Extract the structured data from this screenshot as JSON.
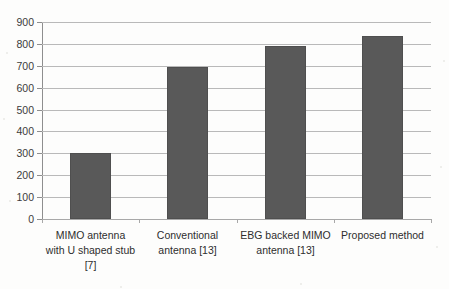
{
  "chart_data": {
    "type": "bar",
    "title": "",
    "xlabel": "",
    "ylabel": "",
    "categories": [
      "MIMO antenna with U shaped stub [7]",
      "Conventional antenna [13]",
      "EBG backed MIMO antenna [13]",
      "Proposed method"
    ],
    "category_lines": [
      [
        "MIMO antenna",
        "with U shaped stub",
        "[7]"
      ],
      [
        "Conventional",
        "antenna [13]"
      ],
      [
        "EBG backed MIMO",
        "antenna [13]"
      ],
      [
        "Proposed method"
      ]
    ],
    "values": [
      300,
      693,
      790,
      838
    ],
    "ylim": [
      0,
      900
    ],
    "ystep": 100,
    "ytick_labels": [
      "900",
      "800",
      "700",
      "600",
      "500",
      "400",
      "300",
      "200",
      "100",
      "0"
    ],
    "ytick_values": [
      900,
      800,
      700,
      600,
      500,
      400,
      300,
      200,
      100,
      0
    ],
    "grid": true,
    "legend": false,
    "legend_position": "none",
    "series": [
      {
        "name": "",
        "values": [
          300,
          693,
          790,
          838
        ]
      }
    ]
  },
  "style": {
    "bar_color": "#595959",
    "bar_border_color": "#4f4f4f",
    "gridline_color": "#b9b9b9",
    "axis_color": "#8e8e8e",
    "label_color": "#2e2e2e",
    "tick_label_color": "#3b3b3b",
    "background": "#fdfdfc"
  }
}
